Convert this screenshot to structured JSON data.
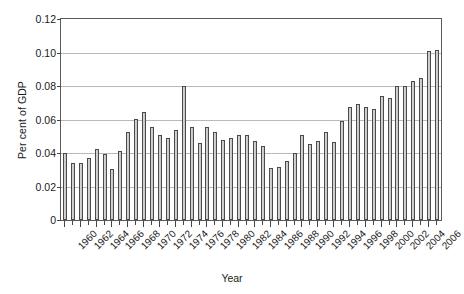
{
  "chart_data": {
    "type": "bar",
    "title": "",
    "xlabel": "Year",
    "ylabel": "Per cent of GDP",
    "ylim": [
      0,
      0.12
    ],
    "ytick_values": [
      0,
      0.02,
      0.04,
      0.06,
      0.08,
      0.1,
      0.12
    ],
    "ytick_labels": [
      "0",
      "0.02",
      "0.04",
      "0.06",
      "0.08",
      "0.10",
      "0.12"
    ],
    "grid": true,
    "legend": "none",
    "xtick_step": 2,
    "categories": [
      "1960",
      "1961",
      "1962",
      "1963",
      "1964",
      "1965",
      "1966",
      "1967",
      "1968",
      "1969",
      "1970",
      "1971",
      "1972",
      "1973",
      "1974",
      "1975",
      "1976",
      "1977",
      "1978",
      "1979",
      "1980",
      "1981",
      "1982",
      "1983",
      "1984",
      "1985",
      "1986",
      "1987",
      "1988",
      "1989",
      "1990",
      "1991",
      "1992",
      "1993",
      "1994",
      "1995",
      "1996",
      "1997",
      "1998",
      "1999",
      "2000",
      "2001",
      "2002",
      "2003",
      "2004",
      "2005",
      "2006",
      "2007"
    ],
    "values": [
      0.04,
      0.034,
      0.0342,
      0.0372,
      0.0424,
      0.0392,
      0.0307,
      0.0414,
      0.0527,
      0.0605,
      0.0643,
      0.0557,
      0.0505,
      0.0488,
      0.0537,
      0.0798,
      0.0557,
      0.046,
      0.0557,
      0.0527,
      0.048,
      0.0489,
      0.051,
      0.0507,
      0.047,
      0.044,
      0.0311,
      0.0316,
      0.035,
      0.04,
      0.051,
      0.0455,
      0.047,
      0.0525,
      0.0466,
      0.0592,
      0.0673,
      0.0693,
      0.0673,
      0.066,
      0.0743,
      0.0729,
      0.08,
      0.0802,
      0.0832,
      0.0845,
      0.101,
      0.1015
    ]
  }
}
